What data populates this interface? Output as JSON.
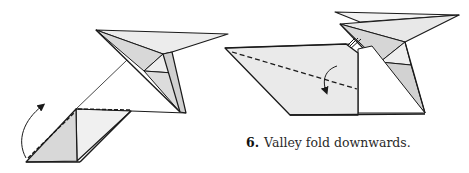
{
  "figure": {
    "step_number": "6.",
    "caption": "Valley fold downwards.",
    "colors": {
      "line": "#1a1a1a",
      "paper_light": "#ededed",
      "paper_mid": "#e2e2e2",
      "paper_dark": "#d4d4d4",
      "background": "#ffffff"
    },
    "diagrams": [
      {
        "name": "step-5-result",
        "arrow": "mountain/valley fold up arrow"
      },
      {
        "name": "step-6",
        "arrow": "valley fold down arrow"
      }
    ]
  }
}
